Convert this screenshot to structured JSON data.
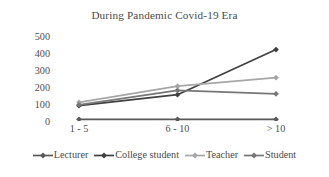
{
  "chart_data": {
    "type": "line",
    "title": "During Pandemic Covid-19 Era",
    "xlabel": "",
    "ylabel": "",
    "categories": [
      "1 - 5",
      "6 - 10",
      "> 10"
    ],
    "ylim": [
      0,
      500
    ],
    "yticks": [
      0,
      100,
      200,
      300,
      400,
      500
    ],
    "ytick_labels": [
      "0",
      "100",
      "200",
      "300",
      "400",
      "500"
    ],
    "grid": false,
    "legend_position": "bottom",
    "marker": "diamond",
    "series": [
      {
        "name": "Lecturer",
        "values": [
          10,
          10,
          10
        ],
        "color": "#595959"
      },
      {
        "name": "College student",
        "values": [
          90,
          155,
          420
        ],
        "color": "#404040"
      },
      {
        "name": "Teacher",
        "values": [
          110,
          205,
          255
        ],
        "color": "#a6a6a6"
      },
      {
        "name": "Student",
        "values": [
          95,
          180,
          160
        ],
        "color": "#777777"
      }
    ]
  },
  "legend": {
    "items": [
      {
        "label": "Lecturer"
      },
      {
        "label": "College student"
      },
      {
        "label": "Teacher"
      },
      {
        "label": "Student"
      }
    ]
  }
}
